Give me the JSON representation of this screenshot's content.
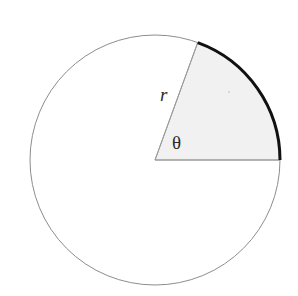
{
  "figure": {
    "kind": "geometry-diagram",
    "background_color": "#ffffff",
    "width": 298,
    "height": 296
  },
  "circle": {
    "name": "full-circle",
    "center_x": 155,
    "center_y": 160,
    "radius": 125,
    "stroke_color": "#8d8d8d",
    "stroke_width": 1,
    "fill_color": "#ffffff"
  },
  "sector": {
    "name": "shaded-sector",
    "start_angle_deg": 0,
    "end_angle_deg": 70,
    "fill_color": "#f1f1f1",
    "edge_stroke_color": "#9a9a9a",
    "edge_stroke_width": 1
  },
  "arc": {
    "name": "highlighted-arc",
    "start_angle_deg": 0,
    "end_angle_deg": 70,
    "stroke_color": "#111111",
    "stroke_width": 3
  },
  "radii": [
    {
      "name": "horizontal-radius",
      "angle_deg": 0,
      "x1": 155,
      "y1": 160,
      "x2": 280,
      "y2": 160,
      "stroke_color": "#9a9a9a"
    },
    {
      "name": "upper-radius",
      "angle_deg": 70,
      "x1": 155,
      "y1": 160,
      "x2": 198,
      "y2": 43,
      "stroke_color": "#9a9a9a"
    }
  ],
  "labels": {
    "radius": {
      "text": "r",
      "x": 160,
      "y": 101,
      "font_size": 19,
      "style": "italic",
      "color": "#2b2b2b"
    },
    "angle": {
      "text": "θ",
      "x": 172,
      "y": 149,
      "font_size": 19,
      "style": "upright",
      "color": "#2b2b2b"
    }
  },
  "marks": [
    {
      "name": "speck-artifact",
      "x": 229,
      "y": 92,
      "radius": 0.9,
      "color": "#c9c9c9"
    }
  ]
}
